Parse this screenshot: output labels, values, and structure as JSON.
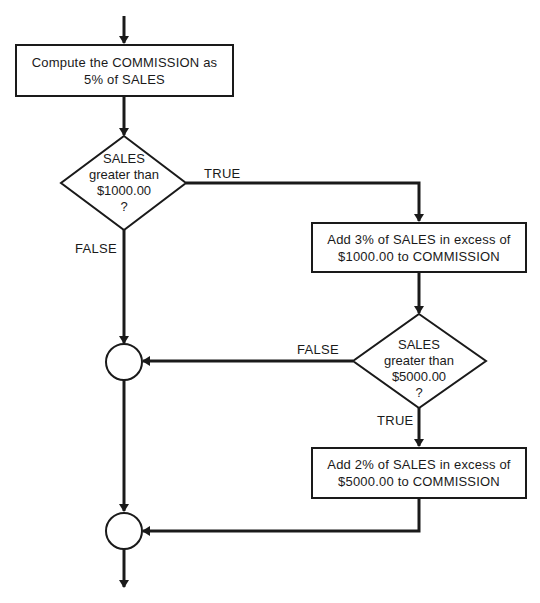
{
  "flowchart": {
    "process_1": {
      "line1": "Compute the COMMISSION as",
      "line2": "5% of SALES"
    },
    "decision_1": {
      "line1": "SALES",
      "line2": "greater than",
      "line3": "$1000.00",
      "line4": "?"
    },
    "decision_1_true_label": "TRUE",
    "decision_1_false_label": "FALSE",
    "process_2": {
      "line1": "Add 3% of SALES in excess of",
      "line2": "$1000.00 to COMMISSION"
    },
    "decision_2": {
      "line1": "SALES",
      "line2": "greater than",
      "line3": "$5000.00",
      "line4": "?"
    },
    "decision_2_false_label": "FALSE",
    "decision_2_true_label": "TRUE",
    "process_3": {
      "line1": "Add 2% of SALES in excess of",
      "line2": "$5000.00 to COMMISSION"
    },
    "connectors": [
      "junction-1",
      "junction-2"
    ],
    "colors": {
      "stroke": "#1a1a1a",
      "background": "#ffffff"
    }
  }
}
